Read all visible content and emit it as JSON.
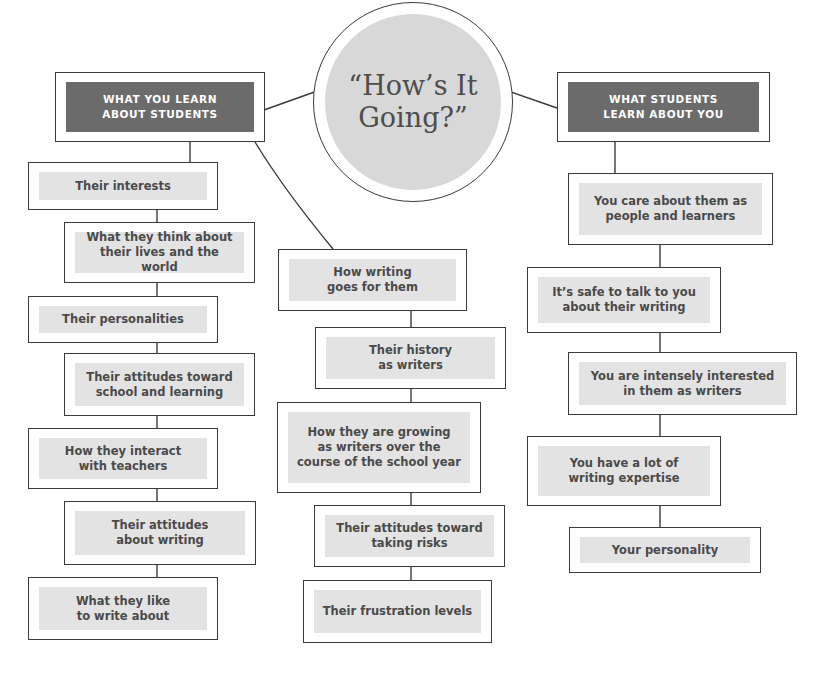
{
  "center": {
    "title": "“How’s It\nGoing?”"
  },
  "left_column": {
    "header": "WHAT YOU LEARN\nABOUT STUDENTS",
    "items": [
      "Their interests",
      "What they think about\ntheir lives and the world",
      "Their personalities",
      "Their attitudes toward\nschool and learning",
      "How they interact\nwith teachers",
      "Their attitudes\nabout writing",
      "What they like\nto write about"
    ]
  },
  "middle_column": {
    "items": [
      "How writing\ngoes for them",
      "Their history\nas writers",
      "How they are growing\nas writers over the\ncourse of the school year",
      "Their attitudes toward\ntaking risks",
      "Their frustration levels"
    ]
  },
  "right_column": {
    "header": "WHAT STUDENTS\nLEARN ABOUT YOU",
    "items": [
      "You care about them as\npeople and learners",
      "It’s safe to talk to you\nabout their writing",
      "You are intensely interested\nin them as writers",
      "You have a lot of\nwriting expertise",
      "Your personality"
    ]
  },
  "colors": {
    "header_fill": "#6b6b6b",
    "item_fill": "#e3e3e3",
    "circle_fill": "#d8d8d8",
    "stroke": "#3a3a3a",
    "text": "#4a4a4a"
  }
}
